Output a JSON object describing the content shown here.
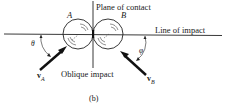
{
  "diagram": {
    "title": "Oblique impact",
    "caption": "(b)",
    "labels": {
      "plane_of_contact": "Plane of contact",
      "line_of_impact": "Line of impact",
      "oblique_impact": "Oblique impact",
      "body_a": "A",
      "body_b": "B",
      "angle_a": "θ",
      "angle_b": "φ",
      "velocity_a_main": "v",
      "velocity_a_sub": "A",
      "velocity_b_main": "v",
      "velocity_b_sub": "B"
    },
    "colors": {
      "ink": "#111111",
      "background": "#ffffff"
    }
  }
}
